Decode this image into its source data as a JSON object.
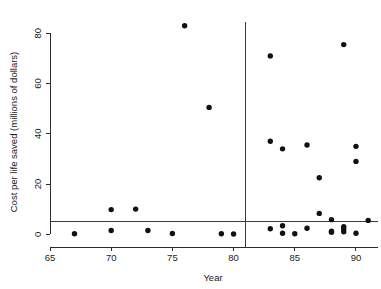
{
  "chart_data": {
    "type": "scatter",
    "title": "",
    "xlabel": "Year",
    "ylabel": "Cost per life saved (millions of dollars)",
    "xlim": [
      65,
      91.8
    ],
    "ylim": [
      -1.5,
      84.5
    ],
    "xticks": [
      65,
      70,
      75,
      80,
      85,
      90
    ],
    "xtick_labels": [
      "65",
      "70",
      "75",
      "80",
      "85",
      "90"
    ],
    "yticks": [
      0,
      20,
      40,
      60,
      80
    ],
    "ytick_labels": [
      "0",
      "20",
      "40",
      "60",
      "80"
    ],
    "grid": false,
    "legend": null,
    "marker": "filled-circle",
    "marker_color": "#111111",
    "reference_lines": [
      {
        "name": "regulation-year-line",
        "orientation": "vertical",
        "value": 81,
        "color": "#3a3a3a"
      },
      {
        "name": "cost-threshold-line",
        "orientation": "horizontal",
        "value": 5,
        "color": "#3a3a3a"
      }
    ],
    "points": [
      {
        "x": 67,
        "y": 0.2
      },
      {
        "x": 70,
        "y": 9.8
      },
      {
        "x": 70,
        "y": 1.5
      },
      {
        "x": 72,
        "y": 10.0
      },
      {
        "x": 73,
        "y": 1.5
      },
      {
        "x": 75,
        "y": 0.3
      },
      {
        "x": 76,
        "y": 83.0
      },
      {
        "x": 78,
        "y": 50.5
      },
      {
        "x": 79,
        "y": 0.2
      },
      {
        "x": 80,
        "y": 0.1
      },
      {
        "x": 83,
        "y": 71.0
      },
      {
        "x": 83,
        "y": 37.0
      },
      {
        "x": 83,
        "y": 2.2
      },
      {
        "x": 84,
        "y": 34.0
      },
      {
        "x": 84,
        "y": 3.4
      },
      {
        "x": 84,
        "y": 0.4
      },
      {
        "x": 85,
        "y": 0.2
      },
      {
        "x": 86,
        "y": 35.5
      },
      {
        "x": 86,
        "y": 2.4
      },
      {
        "x": 87,
        "y": 22.5
      },
      {
        "x": 87,
        "y": 8.3
      },
      {
        "x": 88,
        "y": 5.8
      },
      {
        "x": 88,
        "y": 1.2
      },
      {
        "x": 88,
        "y": 0.8
      },
      {
        "x": 89,
        "y": 75.5
      },
      {
        "x": 89,
        "y": 3.0
      },
      {
        "x": 89,
        "y": 2.2
      },
      {
        "x": 89,
        "y": 1.0
      },
      {
        "x": 90,
        "y": 35.0
      },
      {
        "x": 90,
        "y": 29.0
      },
      {
        "x": 90,
        "y": 0.4
      },
      {
        "x": 91,
        "y": 5.5
      }
    ]
  }
}
